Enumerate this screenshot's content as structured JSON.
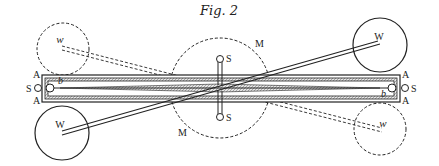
{
  "figure": {
    "title": "Fig. 2",
    "labels": {
      "M_top": "M",
      "M_bottom": "M",
      "S_top": "S",
      "S_bottom": "S",
      "S_left": "S",
      "S_right": "S",
      "A_left_top": "A",
      "A_left_bottom": "A",
      "A_right_top": "A",
      "A_right_bottom": "A",
      "b_left": "b",
      "b_right": "b",
      "W_top_right": "W",
      "W_bottom_left": "W",
      "w_top_left": "w",
      "w_bottom_right": "w"
    },
    "colors": {
      "ink": "#222222",
      "hatch": "#9a9a9a",
      "background": "#ffffff"
    }
  }
}
